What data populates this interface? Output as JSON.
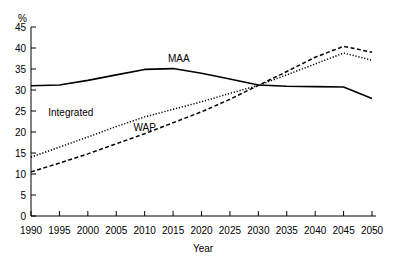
{
  "chart_data": {
    "type": "line",
    "title": "",
    "xlabel": "Year",
    "ylabel": "%",
    "unit_label": "%",
    "xlim": [
      1990,
      2050
    ],
    "ylim": [
      0,
      45
    ],
    "grid": false,
    "legend_position": "inline-annotations",
    "xticks": [
      1990,
      1995,
      2000,
      2005,
      2010,
      2015,
      2020,
      2025,
      2030,
      2035,
      2040,
      2045,
      2050
    ],
    "yticks": [
      0,
      5,
      10,
      15,
      20,
      25,
      30,
      35,
      40,
      45
    ],
    "x": [
      1990,
      1995,
      2000,
      2005,
      2010,
      2015,
      2020,
      2025,
      2030,
      2035,
      2040,
      2045,
      2050
    ],
    "series": [
      {
        "name": "MAA",
        "style": "solid",
        "color": "#000000",
        "label_x": 2016,
        "label_y": 36.6,
        "values": [
          31.0,
          31.2,
          32.3,
          33.6,
          34.9,
          35.1,
          34.0,
          32.6,
          31.2,
          30.9,
          30.8,
          30.7,
          28.0
        ]
      },
      {
        "name": "Integrated",
        "style": "dotted",
        "color": "#000000",
        "label_x": 1997,
        "label_y": 23.8,
        "values": [
          14.0,
          16.4,
          18.8,
          21.3,
          23.6,
          25.4,
          27.2,
          29.2,
          31.1,
          33.6,
          36.2,
          38.8,
          37.1
        ]
      },
      {
        "name": "WAP",
        "style": "dashed",
        "color": "#000000",
        "label_x": 2010,
        "label_y": 20.2,
        "values": [
          10.5,
          12.6,
          14.8,
          17.2,
          19.6,
          22.2,
          24.8,
          27.8,
          31.1,
          34.4,
          37.8,
          40.4,
          39.0
        ]
      }
    ]
  },
  "axis": {
    "x_title": "Year",
    "y_unit": "%"
  }
}
